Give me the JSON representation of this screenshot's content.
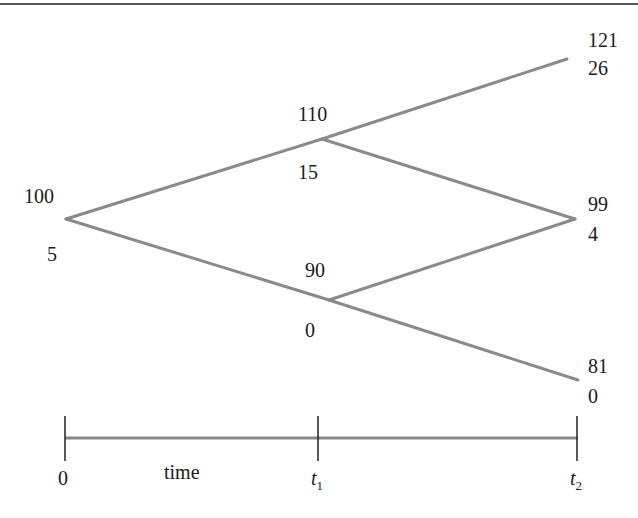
{
  "diagram": {
    "type": "binomial-tree",
    "line_color": "#8a8a8a",
    "nodes": [
      {
        "id": "root",
        "price": "100",
        "value": "5"
      },
      {
        "id": "up",
        "price": "110",
        "value": "15"
      },
      {
        "id": "down",
        "price": "90",
        "value": "0"
      },
      {
        "id": "upup",
        "price": "121",
        "value": "26"
      },
      {
        "id": "updown",
        "price": "99",
        "value": "4"
      },
      {
        "id": "downdown",
        "price": "81",
        "value": "0"
      }
    ],
    "edges": [
      [
        "root",
        "up"
      ],
      [
        "root",
        "down"
      ],
      [
        "up",
        "upup"
      ],
      [
        "up",
        "updown"
      ],
      [
        "down",
        "updown"
      ],
      [
        "down",
        "downdown"
      ]
    ]
  },
  "timeline": {
    "label": "time",
    "ticks": [
      {
        "label": "0",
        "sub": ""
      },
      {
        "label": "t",
        "sub": "1"
      },
      {
        "label": "t",
        "sub": "2"
      }
    ]
  }
}
